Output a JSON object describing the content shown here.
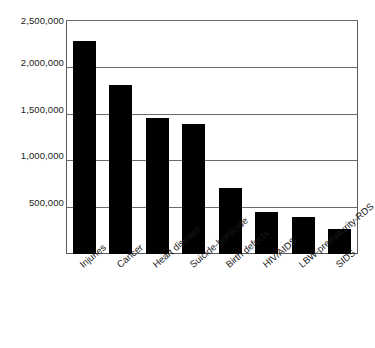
{
  "chart_data": {
    "type": "bar",
    "title": "",
    "subtitle": "",
    "xlabel": "",
    "ylabel": "",
    "categories": [
      "Injuries",
      "Cancer",
      "Heart disease",
      "Suicide-homicide",
      "Birth defects",
      "HIV/AIDS",
      "LBW-prematurity-RDS",
      "SIDS"
    ],
    "values": [
      2280000,
      1810000,
      1450000,
      1390000,
      700000,
      450000,
      390000,
      265000
    ],
    "ylim": [
      0,
      2500000
    ],
    "ytick_values": [
      500000,
      1000000,
      1500000,
      2000000,
      2500000
    ],
    "ytick_labels": [
      "500,000",
      "1,000,000",
      "1,500,000",
      "2,000,000",
      "2,500,000"
    ],
    "grid": true,
    "grid_axis": "y",
    "legend": false,
    "legend_position": "none",
    "bar_color": "#000000",
    "frame_color": "#5a5a5a",
    "background_color": "#ffffff",
    "xtick_label_rotation": -40,
    "annotations": []
  },
  "axes": {
    "y": {
      "ticks": [
        {
          "label": "2,500,000",
          "value": 2500000
        },
        {
          "label": "2,000,000",
          "value": 2000000
        },
        {
          "label": "1,500,000",
          "value": 1500000
        },
        {
          "label": "1,000,000",
          "value": 1000000
        },
        {
          "label": "500,000",
          "value": 500000
        }
      ]
    },
    "x": {
      "ticks": [
        {
          "label": "Injuries"
        },
        {
          "label": "Cancer"
        },
        {
          "label": "Heart disease"
        },
        {
          "label": "Suicide-homicide"
        },
        {
          "label": "Birth defects"
        },
        {
          "label": "HIV/AIDS"
        },
        {
          "label": "LBW-prematurity-RDS"
        },
        {
          "label": "SIDS"
        }
      ]
    }
  }
}
